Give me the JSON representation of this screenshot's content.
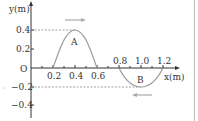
{
  "diagram": {
    "y_axis_label": "y(m)",
    "x_axis_label": "x(m)",
    "origin_label": "O",
    "y_ticks": [
      {
        "value": 0.4,
        "label": "0.4"
      },
      {
        "value": 0.2,
        "label": "0.2"
      },
      {
        "value": -0.2,
        "label": "−0.2"
      },
      {
        "value": -0.4,
        "label": "−0.4"
      }
    ],
    "x_ticks": [
      {
        "value": 0.2,
        "label": "0.2"
      },
      {
        "value": 0.4,
        "label": "0.4"
      },
      {
        "value": 0.6,
        "label": "0.6"
      },
      {
        "value": 0.8,
        "label": "0.8"
      },
      {
        "value": 1.0,
        "label": "1.0"
      },
      {
        "value": 1.2,
        "label": "1.2"
      }
    ],
    "pulses": [
      {
        "name": "A",
        "label": "A",
        "peak_x": 0.4,
        "amplitude": 0.4,
        "start_x": 0.2,
        "end_x": 0.6,
        "direction": "right"
      },
      {
        "name": "B",
        "label": "B",
        "peak_x": 1.0,
        "amplitude": -0.2,
        "start_x": 0.8,
        "end_x": 1.2,
        "direction": "left"
      }
    ],
    "colors": {
      "axis": "#333333",
      "curve": "#9a9a9a",
      "dashed": "#888888",
      "arrow": "#aaaaaa",
      "border": "#bbbbbb"
    }
  }
}
